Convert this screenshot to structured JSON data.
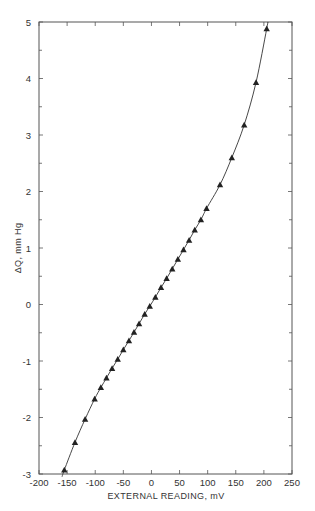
{
  "chart_data": {
    "type": "line",
    "title": "",
    "xlabel": "EXTERNAL READING, mV",
    "ylabel": "ΔQ, mm Hg",
    "xlim": [
      -200,
      250
    ],
    "ylim": [
      -3,
      5
    ],
    "xticks": [
      -200,
      -150,
      -100,
      -50,
      0,
      50,
      100,
      150,
      200,
      250
    ],
    "xtick_labels": [
      "-200",
      "-150",
      "-100",
      "-50",
      "0",
      "50",
      "100",
      "150",
      "200",
      "250"
    ],
    "yticks": [
      -3,
      -2,
      -1,
      0,
      1,
      2,
      3,
      4,
      5
    ],
    "ytick_labels": [
      "-3",
      "-2",
      "-1",
      "0",
      "1",
      "2",
      "3",
      "4",
      "5"
    ],
    "y_minor_step": 0.5,
    "grid": false,
    "legend": "none",
    "series": [
      {
        "name": "measurements",
        "marker": "triangle",
        "line": "smooth-fit",
        "x": [
          -155,
          -136,
          -118,
          -101,
          -90,
          -80,
          -70,
          -60,
          -50,
          -40,
          -31,
          -22,
          -12,
          -3,
          7,
          17,
          27,
          37,
          47,
          57,
          67,
          77,
          88,
          98,
          122,
          143,
          165,
          186,
          205
        ],
        "y": [
          -2.93,
          -2.44,
          -2.03,
          -1.67,
          -1.47,
          -1.3,
          -1.13,
          -0.97,
          -0.8,
          -0.64,
          -0.49,
          -0.34,
          -0.17,
          -0.03,
          0.13,
          0.3,
          0.46,
          0.63,
          0.8,
          0.97,
          1.14,
          1.32,
          1.5,
          1.7,
          2.12,
          2.6,
          3.18,
          3.93,
          4.88
        ]
      }
    ]
  }
}
